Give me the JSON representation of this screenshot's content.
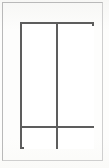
{
  "document": {
    "type": "line-drawing",
    "title": "Rectangular panel elevation",
    "background_color": "#fdfdfc",
    "page_border_color": "#b9b9b9",
    "line_color": "#5d5d5d",
    "panel_fill_color": "#ffffff",
    "line_weight_px": 2,
    "width_px": 109,
    "height_px": 168
  },
  "drawing": {
    "outer_rectangle": {
      "name": "outer-rectangle",
      "x": 20,
      "y": 22,
      "width": 74,
      "height": 127
    },
    "dividers": [
      {
        "name": "vertical-divider",
        "orientation": "vertical",
        "position_px": 54,
        "thickness_px": 2
      },
      {
        "name": "horizontal-divider",
        "orientation": "horizontal",
        "position_px": 126,
        "thickness_px": 2
      }
    ],
    "panels": [
      {
        "name": "top-left-panel",
        "label": "",
        "row": 1,
        "column": 1
      },
      {
        "name": "top-right-panel",
        "label": "",
        "row": 1,
        "column": 2
      },
      {
        "name": "bottom-left-panel",
        "label": "",
        "row": 2,
        "column": 1
      },
      {
        "name": "bottom-right-panel",
        "label": "",
        "row": 2,
        "column": 2
      }
    ]
  }
}
